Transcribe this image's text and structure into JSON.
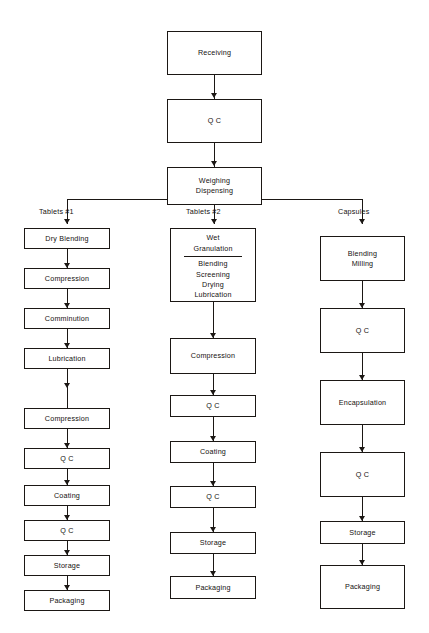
{
  "diagram": {
    "ink_color": "#1b1714",
    "background_color": "#ffffff",
    "intake": [
      {
        "label": "Receiving"
      },
      {
        "label": "Q C"
      }
    ],
    "split_node": {
      "line1": "Weighing",
      "line2": "Dispensing"
    },
    "branch_labels": {
      "left": "Tablets #1",
      "middle": "Tablets #2",
      "right": "Capsules"
    },
    "columns": {
      "left": {
        "name": "Tablets #1",
        "steps": [
          {
            "label": "Dry Blending"
          },
          {
            "label": "Compression"
          },
          {
            "label": "Comminution"
          },
          {
            "label": "Lubrication"
          },
          {
            "label": "Compression"
          },
          {
            "label": "Q C"
          },
          {
            "label": "Coating"
          },
          {
            "label": "Q C"
          },
          {
            "label": "Storage"
          },
          {
            "label": "Packaging"
          }
        ]
      },
      "middle": {
        "name": "Tablets #2",
        "granulation": {
          "head_line1": "Wet",
          "head_line2": "Granulation",
          "sub_steps": [
            "Blending",
            "Screening",
            "Drying",
            "Lubrication"
          ]
        },
        "steps": [
          {
            "label": "Compression"
          },
          {
            "label": "Q C"
          },
          {
            "label": "Coating"
          },
          {
            "label": "Q C"
          },
          {
            "label": "Storage"
          },
          {
            "label": "Packaging"
          }
        ]
      },
      "right": {
        "name": "Capsules",
        "first": {
          "line1": "Blending",
          "line2": "Milling"
        },
        "steps": [
          {
            "label": "Q C"
          },
          {
            "label": "Encapsulation"
          },
          {
            "label": "Q C"
          },
          {
            "label": "Storage"
          },
          {
            "label": "Packaging"
          }
        ]
      }
    }
  }
}
